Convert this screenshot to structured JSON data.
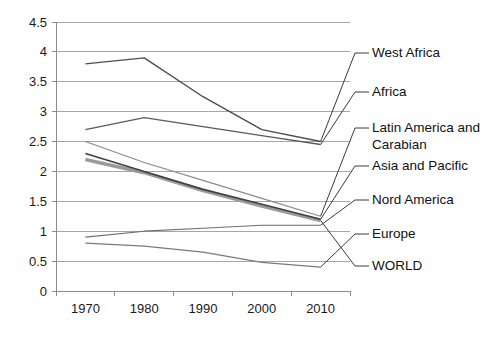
{
  "chart_data": {
    "type": "line",
    "title": "",
    "xlabel": "",
    "ylabel": "",
    "categories": [
      "1970",
      "1980",
      "1990",
      "2000",
      "2010"
    ],
    "x": [
      1970,
      1980,
      1990,
      2000,
      2010
    ],
    "ylim": [
      0,
      4.5
    ],
    "yticks": [
      "0",
      "0.5",
      "1",
      "1.5",
      "2",
      "2.5",
      "3",
      "3.5",
      "4",
      "4.5"
    ],
    "ytick_values": [
      0,
      0.5,
      1,
      1.5,
      2,
      2.5,
      3,
      3.5,
      4,
      4.5
    ],
    "grid": true,
    "legend_position": "right-callouts",
    "series": [
      {
        "name": "West Africa",
        "values": [
          3.8,
          3.9,
          3.25,
          2.7,
          2.5
        ],
        "color": "#4d4d4d",
        "width": 1.4
      },
      {
        "name": "Africa",
        "values": [
          2.7,
          2.9,
          2.75,
          2.6,
          2.45
        ],
        "color": "#5a5a5a",
        "width": 1.4
      },
      {
        "name": "Latin America and Carabian",
        "values": [
          2.5,
          2.15,
          1.85,
          1.55,
          1.25
        ],
        "color": "#8c8c8c",
        "width": 1.2
      },
      {
        "name": "Asia and Pacific",
        "values": [
          2.3,
          2.0,
          1.7,
          1.45,
          1.2
        ],
        "color": "#3f3f3f",
        "width": 1.6
      },
      {
        "name": "Nord America",
        "values": [
          0.9,
          1.0,
          1.05,
          1.1,
          1.1
        ],
        "color": "#6e6e6e",
        "width": 1.2
      },
      {
        "name": "Europe",
        "values": [
          0.8,
          0.75,
          0.65,
          0.48,
          0.4
        ],
        "color": "#7a7a7a",
        "width": 1.2
      },
      {
        "name": "WORLD",
        "values": [
          2.2,
          1.98,
          1.68,
          1.42,
          1.18
        ],
        "color": "#9a9a9a",
        "width": 3.6
      }
    ],
    "callouts": [
      {
        "label": "West Africa",
        "series": "West Africa"
      },
      {
        "label": "Africa",
        "series": "Africa"
      },
      {
        "label": "Latin America and",
        "label2": "Carabian",
        "series": "Latin America and Carabian"
      },
      {
        "label": "Asia and Pacific",
        "series": "Asia and Pacific"
      },
      {
        "label": "Nord America",
        "series": "Nord America"
      },
      {
        "label": "Europe",
        "series": "Europe"
      },
      {
        "label": "WORLD",
        "series": "WORLD"
      }
    ]
  }
}
